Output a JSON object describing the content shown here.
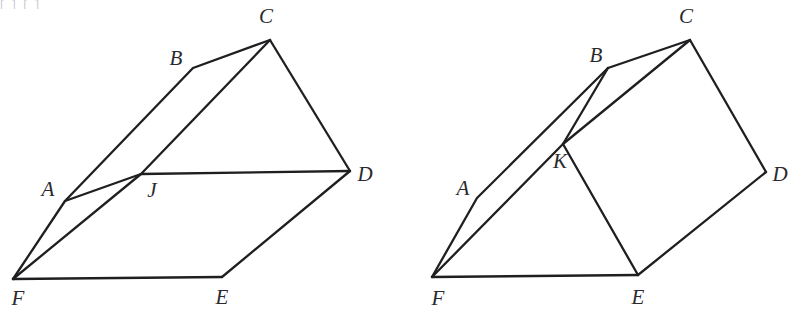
{
  "figure": {
    "clipped_header_text": "[      ]      [            ]",
    "background_color": "#ffffff",
    "stroke_color": "#1f1f22",
    "label_color": "#2a2a2e",
    "panels": [
      {
        "id": "left-panel",
        "name": "prism-figure-with-point-J",
        "vertices": [
          {
            "label": "A",
            "vx": 65,
            "vy": 201,
            "lx": 48,
            "ly": 191
          },
          {
            "label": "B",
            "vx": 193,
            "vy": 68,
            "lx": 176,
            "ly": 60
          },
          {
            "label": "C",
            "vx": 270,
            "vy": 40,
            "lx": 266,
            "ly": 18
          },
          {
            "label": "D",
            "vx": 350,
            "vy": 171,
            "lx": 365,
            "ly": 176
          },
          {
            "label": "E",
            "vx": 222,
            "vy": 277,
            "lx": 222,
            "ly": 299
          },
          {
            "label": "F",
            "vx": 13,
            "vy": 279,
            "lx": 18,
            "ly": 300
          },
          {
            "label": "J",
            "vx": 141,
            "vy": 174,
            "lx": 152,
            "ly": 192
          }
        ],
        "paths": [
          {
            "name": "edge-F-A-B-C",
            "points": "13,279 65,201 193,68 270,40"
          },
          {
            "name": "edge-C-D",
            "points": "270,40 350,171"
          },
          {
            "name": "edge-D-E",
            "points": "350,171 222,277"
          },
          {
            "name": "edge-E-F",
            "points": "222,277 13,279"
          },
          {
            "name": "edge-F-J-C",
            "points": "13,279 141,174 270,40"
          },
          {
            "name": "edge-A-J-D",
            "points": "65,201 141,174 350,171"
          }
        ]
      },
      {
        "id": "right-panel",
        "name": "folded-prism-figure-with-point-K",
        "vertices": [
          {
            "label": "A",
            "vx": 477,
            "vy": 198,
            "lx": 463,
            "ly": 190
          },
          {
            "label": "B",
            "vx": 608,
            "vy": 68,
            "lx": 596,
            "ly": 57
          },
          {
            "label": "C",
            "vx": 690,
            "vy": 40,
            "lx": 686,
            "ly": 18
          },
          {
            "label": "D",
            "vx": 766,
            "vy": 172,
            "lx": 780,
            "ly": 176
          },
          {
            "label": "E",
            "vx": 638,
            "vy": 275,
            "lx": 638,
            "ly": 299
          },
          {
            "label": "F",
            "vx": 432,
            "vy": 277,
            "lx": 438,
            "ly": 300
          },
          {
            "label": "K",
            "vx": 563,
            "vy": 144,
            "lx": 560,
            "ly": 163
          }
        ],
        "paths": [
          {
            "name": "edge-F-A-B",
            "points": "432,277 477,198 608,68"
          },
          {
            "name": "edge-B-C",
            "points": "608,68 690,40"
          },
          {
            "name": "edge-C-D",
            "points": "690,40 766,172"
          },
          {
            "name": "edge-D-E",
            "points": "766,172 638,275"
          },
          {
            "name": "edge-E-F",
            "points": "638,275 432,277"
          },
          {
            "name": "edge-F-K-B",
            "points": "432,277 563,144 608,68"
          },
          {
            "name": "edge-K-C",
            "points": "563,144 690,40"
          },
          {
            "name": "edge-K-E",
            "points": "563,144 638,275"
          }
        ]
      }
    ]
  }
}
